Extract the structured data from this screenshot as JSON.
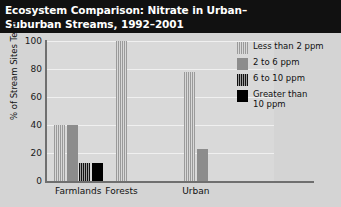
{
  "title": {
    "line1": "Ecosystem Comparison: Nitrate in Urban–",
    "line2": "Suburban Streams, 1992–2001"
  },
  "chart_data": {
    "type": "bar",
    "xlabel": "",
    "ylabel": "% of Stream Sites Tested",
    "ylim": [
      0,
      100
    ],
    "yticks": [
      "0",
      "20",
      "40",
      "60",
      "80",
      "100"
    ],
    "grid": true,
    "legend_position": "right",
    "categories": [
      "Farmlands",
      "Forests",
      "Urban"
    ],
    "series": [
      {
        "name": "Less than 2 ppm",
        "swatch": "stripe-light",
        "color": "#b8b8b8",
        "values": [
          40,
          100,
          78
        ]
      },
      {
        "name": "2 to 6 ppm",
        "swatch": "solid-gray",
        "color": "#8c8c8c",
        "values": [
          40,
          0,
          23
        ]
      },
      {
        "name": "6 to 10 ppm",
        "swatch": "stripe-dark",
        "color": "#2a2a2a",
        "values": [
          13,
          0,
          0
        ]
      },
      {
        "name": "Greater than 10 ppm",
        "swatch": "solid-black",
        "color": "#000000",
        "values": [
          13,
          0,
          0
        ]
      }
    ]
  },
  "legend": {
    "items": [
      {
        "label_line1": "Less than 2 ppm",
        "label_line2": ""
      },
      {
        "label_line1": "2 to 6 ppm",
        "label_line2": ""
      },
      {
        "label_line1": "6 to 10 ppm",
        "label_line2": ""
      },
      {
        "label_line1": "Greater than",
        "label_line2": "10 ppm"
      }
    ]
  },
  "colors": {
    "title_bar_bg": "#111111",
    "title_text": "#ffffff",
    "page_bg": "#d4d4d4",
    "plot_bg": "#d9d9d9",
    "axis": "#6f6f6f",
    "gridline": "#f0f0f0"
  }
}
